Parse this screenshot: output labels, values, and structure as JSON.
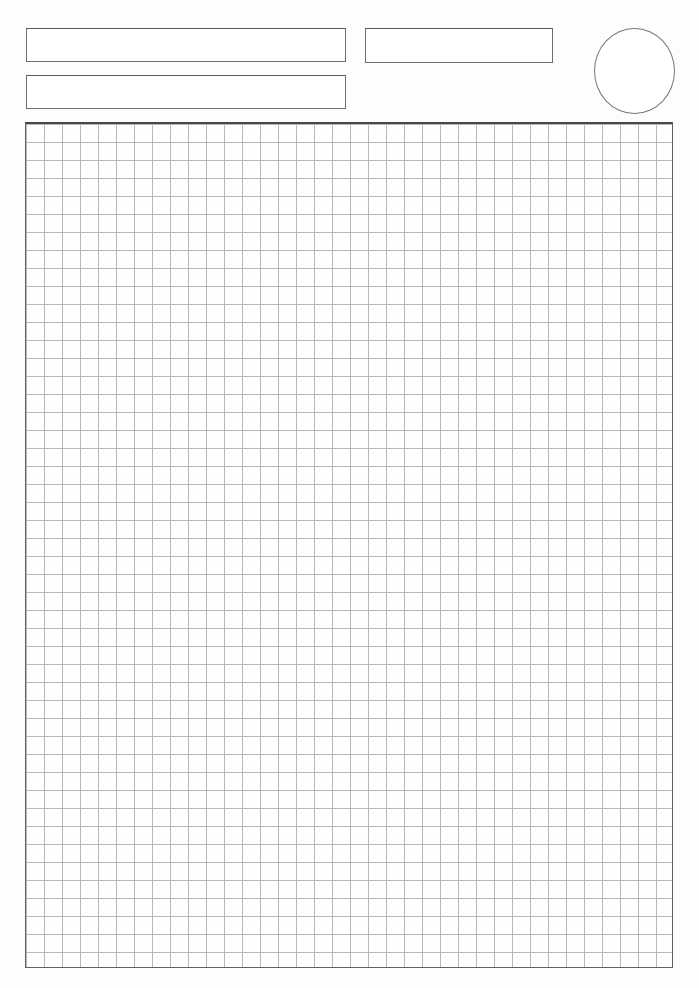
{
  "page": {
    "kind": "blank worksheet page with header fields and graph-paper grid",
    "background_color": "#fdfdfd"
  },
  "header": {
    "field_box_1": {
      "value": ""
    },
    "field_box_2": {
      "value": ""
    },
    "field_box_3": {
      "value": ""
    },
    "circle_badge": {
      "value": ""
    }
  },
  "grid": {
    "columns": 36,
    "rows": 47,
    "cell_size_px": 18,
    "line_color": "#b6b9b9",
    "border_color": "#606060",
    "border_top_color": "#474747"
  },
  "colors": {
    "box_outline": "#6e6e6e",
    "circle_outline": "#787878"
  }
}
